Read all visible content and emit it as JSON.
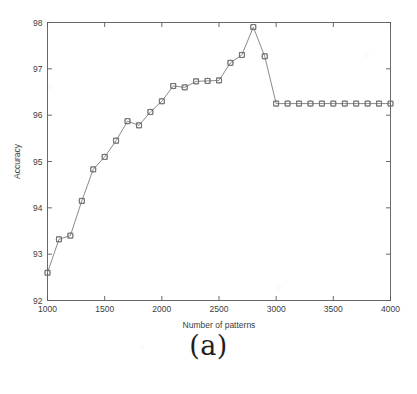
{
  "figure": {
    "caption": "(a)"
  },
  "chart_data": {
    "type": "line",
    "title": "",
    "xlabel": "Number of patterns",
    "ylabel": "Accuracy",
    "xlim": [
      1000,
      4000
    ],
    "ylim": [
      92,
      98
    ],
    "xticks": [
      1000,
      1500,
      2000,
      2500,
      3000,
      3500,
      4000
    ],
    "xticklabels": [
      "1000",
      "1500",
      "2000",
      "2500",
      "3000",
      "3500",
      "4000"
    ],
    "yticks": [
      92,
      93,
      94,
      95,
      96,
      97,
      98
    ],
    "yticklabels": [
      "92",
      "93",
      "94",
      "95",
      "96",
      "97",
      "98"
    ],
    "grid": false,
    "legend": null,
    "line_color": "#7d7d7d",
    "marker_color": "#6e6e6e",
    "marker": "square-circle",
    "x": [
      1000,
      1100,
      1200,
      1300,
      1400,
      1500,
      1600,
      1700,
      1800,
      1900,
      2000,
      2100,
      2200,
      2300,
      2400,
      2500,
      2600,
      2700,
      2800,
      2900,
      3000,
      3100,
      3200,
      3300,
      3400,
      3500,
      3600,
      3700,
      3800,
      3900,
      4000
    ],
    "values": [
      92.6,
      93.32,
      93.4,
      94.15,
      94.83,
      95.1,
      95.45,
      95.87,
      95.78,
      96.07,
      96.3,
      96.63,
      96.6,
      96.73,
      96.74,
      96.75,
      97.13,
      97.3,
      97.9,
      97.27,
      96.25,
      96.25,
      96.25,
      96.25,
      96.25,
      96.25,
      96.25,
      96.25,
      96.25,
      96.25,
      96.25
    ]
  }
}
